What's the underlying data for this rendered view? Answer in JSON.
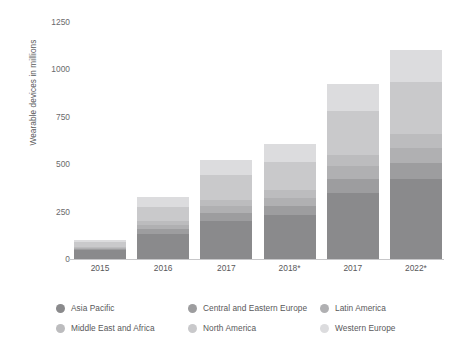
{
  "chart_data": {
    "type": "bar",
    "subtype": "stacked-bar",
    "title": "",
    "xlabel": "",
    "ylabel": "Wearable devices in millions",
    "ylim": [
      0,
      1250
    ],
    "yticks": [
      0,
      250,
      500,
      750,
      1000,
      1250
    ],
    "ytick_labels": [
      "0",
      "250",
      "500",
      "750",
      "1000",
      "1250"
    ],
    "grid": false,
    "legend_position": "bottom",
    "categories": [
      "2015",
      "2016",
      "2017",
      "2018*",
      "2017",
      "2022*"
    ],
    "series": [
      {
        "name": "Asia Pacific",
        "color": "#8a8a8c",
        "values": [
          45,
          130,
          200,
          232,
          350,
          420
        ]
      },
      {
        "name": "Central and Eastern Europe",
        "color": "#9d9d9f",
        "values": [
          8,
          26,
          42,
          48,
          74,
          88
        ]
      },
      {
        "name": "Latin America",
        "color": "#b0b0b2",
        "values": [
          7,
          24,
          38,
          44,
          67,
          80
        ]
      },
      {
        "name": "Middle East and Africa",
        "color": "#bcbcbe",
        "values": [
          6,
          20,
          33,
          38,
          58,
          70
        ]
      },
      {
        "name": "North America",
        "color": "#c9c9cb",
        "values": [
          22,
          72,
          130,
          150,
          230,
          275
        ]
      },
      {
        "name": "Western Europe",
        "color": "#dcdcde",
        "values": [
          12,
          53,
          82,
          93,
          146,
          172
        ]
      }
    ],
    "totals": [
      100,
      325,
      525,
      605,
      925,
      1105
    ],
    "legend_entries": [
      "Asia Pacific",
      "Central and Eastern Europe",
      "Latin America",
      "Middle East and Africa",
      "North America",
      "Western Europe"
    ]
  }
}
